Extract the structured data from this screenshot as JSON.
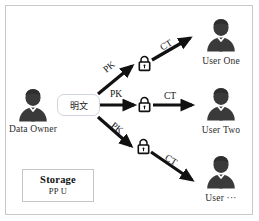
{
  "diagram": {
    "border_color": "#c9c9c9",
    "background": "#ffffff",
    "arrow_color": "#111111",
    "avatar_color": "#3a3a3a"
  },
  "source": {
    "label": "Data Owner",
    "icon": "user-avatar-icon"
  },
  "plaintext": {
    "label": "明文"
  },
  "locks": [
    {
      "icon": "padlock-icon",
      "name": "lock-upper"
    },
    {
      "icon": "padlock-icon",
      "name": "lock-middle"
    },
    {
      "icon": "padlock-icon",
      "name": "lock-lower"
    }
  ],
  "edges": [
    {
      "label": "PK",
      "name": "edge-pk-upper"
    },
    {
      "label": "PK",
      "name": "edge-pk-middle"
    },
    {
      "label": "PK",
      "name": "edge-pk-lower"
    },
    {
      "label": "CT",
      "name": "edge-ct-upper"
    },
    {
      "label": "CT",
      "name": "edge-ct-middle"
    },
    {
      "label": "CT",
      "name": "edge-ct-lower"
    }
  ],
  "recipients": [
    {
      "label": "User One",
      "icon": "user-avatar-icon"
    },
    {
      "label": "User Two",
      "icon": "user-avatar-icon"
    },
    {
      "label": "User ···",
      "icon": "user-avatar-icon"
    }
  ],
  "storage": {
    "title": "Storage",
    "subtitle": "PP U"
  }
}
